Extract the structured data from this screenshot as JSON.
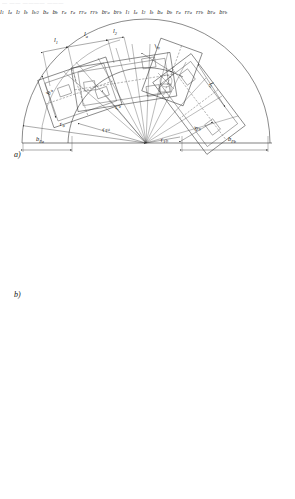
{
  "page": {
    "header_text": "— —— ———— ———",
    "width": 295,
    "height": 499,
    "background": "#ffffff",
    "ink_color": "#2b2b2b"
  },
  "figure": {
    "kind": "engineering-line-drawing",
    "panels": [
      {
        "id": "a",
        "label": "a)",
        "center": {
          "x": 146,
          "y": 143
        },
        "outer_radius": 124,
        "inner_radius": 78,
        "baseline_y": 143,
        "labels": [
          {
            "key": "l1",
            "text": "l",
            "sub": "1",
            "x": 54,
            "y": 42
          },
          {
            "key": "la",
            "text": "l",
            "sub": "a",
            "x": 84,
            "y": 36
          },
          {
            "key": "l2",
            "text": "l",
            "sub": "2",
            "x": 113,
            "y": 33
          },
          {
            "key": "lb_top",
            "text": "l",
            "sub": "b",
            "x": 156,
            "y": 49
          },
          {
            "key": "lb_right",
            "text": "l",
            "sub": "b",
            "x": 209,
            "y": 84
          },
          {
            "key": "ba",
            "text": "b",
            "sub": "a",
            "x": 50,
            "y": 95
          },
          {
            "key": "bb",
            "text": "b",
            "sub": "b",
            "x": 196,
            "y": 131
          },
          {
            "key": "ra",
            "text": "r",
            "sub": "a",
            "x": 118,
            "y": 110
          },
          {
            "key": "rFa",
            "text": "r",
            "sub": "Fa",
            "x": 64,
            "y": 124
          },
          {
            "key": "rFa2",
            "text": "r",
            "sub": "Fa",
            "x": 105,
            "y": 130
          },
          {
            "key": "rFb",
            "text": "r",
            "sub": "Fb",
            "x": 163,
            "y": 141
          },
          {
            "key": "bFa",
            "text": "b",
            "sub": "Fa",
            "x": 44,
            "y": 140
          },
          {
            "key": "bFb",
            "text": "b",
            "sub": "Fb",
            "x": 235,
            "y": 140
          }
        ]
      },
      {
        "id": "b",
        "label": "b)",
        "center": {
          "x": 140,
          "y": 284
        },
        "outer_radius": 118,
        "inner_radius": 76,
        "baseline_y": 284,
        "labels": [
          {
            "key": "l1",
            "text": "l",
            "sub": "1",
            "x": 52,
            "y": 181
          },
          {
            "key": "la",
            "text": "l",
            "sub": "a",
            "x": 80,
            "y": 175
          },
          {
            "key": "l2",
            "text": "l",
            "sub": "2",
            "x": 107,
            "y": 170
          },
          {
            "key": "lb",
            "text": "l",
            "sub": "b",
            "x": 152,
            "y": 185
          },
          {
            "key": "lb2",
            "text": "l",
            "sub": "b/2",
            "x": 190,
            "y": 196
          },
          {
            "key": "ba",
            "text": "b",
            "sub": "a",
            "x": 52,
            "y": 232
          },
          {
            "key": "bb",
            "text": "b",
            "sub": "b",
            "x": 208,
            "y": 253
          },
          {
            "key": "ra",
            "text": "r",
            "sub": "a",
            "x": 114,
            "y": 244
          },
          {
            "key": "rFa",
            "text": "r",
            "sub": "Fa",
            "x": 62,
            "y": 262
          },
          {
            "key": "rFa2",
            "text": "r",
            "sub": "Fa",
            "x": 100,
            "y": 266
          },
          {
            "key": "rFb",
            "text": "r",
            "sub": "Fb",
            "x": 172,
            "y": 274
          },
          {
            "key": "bFa",
            "text": "b",
            "sub": "Fa",
            "x": 44,
            "y": 280
          },
          {
            "key": "bFb",
            "text": "b",
            "sub": "Fb",
            "x": 220,
            "y": 281
          }
        ]
      },
      {
        "id": "c",
        "label": "",
        "center": {
          "x": 139,
          "y": 485
        },
        "outer_radius": 176,
        "inner_radius": 108,
        "baseline_y": 485,
        "labels": [
          {
            "key": "l1",
            "text": "l",
            "sub": "1",
            "x": 35,
            "y": 334
          },
          {
            "key": "la",
            "text": "l",
            "sub": "a",
            "x": 58,
            "y": 326
          },
          {
            "key": "l2",
            "text": "l",
            "sub": "2",
            "x": 83,
            "y": 333
          },
          {
            "key": "lb",
            "text": "l",
            "sub": "b",
            "x": 167,
            "y": 382
          },
          {
            "key": "ba",
            "text": "b",
            "sub": "a",
            "x": 38,
            "y": 388
          },
          {
            "key": "bb",
            "text": "b",
            "sub": "b",
            "x": 196,
            "y": 477
          },
          {
            "key": "ra",
            "text": "r",
            "sub": "a",
            "x": 26,
            "y": 440
          },
          {
            "key": "rFa",
            "text": "r",
            "sub": "Fa",
            "x": 85,
            "y": 453
          },
          {
            "key": "rFb",
            "text": "r",
            "sub": "Fb",
            "x": 153,
            "y": 479
          },
          {
            "key": "bFa",
            "text": "b",
            "sub": "Fa",
            "x": 9,
            "y": 478
          },
          {
            "key": "bFb",
            "text": "b",
            "sub": "Fb",
            "x": 218,
            "y": 496
          }
        ]
      }
    ]
  }
}
